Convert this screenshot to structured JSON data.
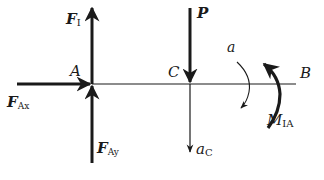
{
  "diagram": {
    "type": "free-body-diagram",
    "beam": {
      "label_left": "A",
      "label_mid": "C",
      "label_right": "B"
    },
    "forces": [
      {
        "id": "FI",
        "symbol": "F",
        "subscript": "I",
        "direction": "up",
        "at": "A"
      },
      {
        "id": "FAx",
        "symbol": "F",
        "subscript": "Ax",
        "direction": "right",
        "at": "A"
      },
      {
        "id": "FAy",
        "symbol": "F",
        "subscript": "Ay",
        "direction": "up",
        "at": "A"
      },
      {
        "id": "P",
        "symbol": "P",
        "subscript": "",
        "direction": "down",
        "at": "C"
      }
    ],
    "accelerations": [
      {
        "id": "aC",
        "symbol": "a",
        "subscript": "C",
        "direction": "down",
        "at": "C"
      },
      {
        "id": "alpha",
        "symbol": "a",
        "subscript": "",
        "direction": "clockwise"
      }
    ],
    "moments": [
      {
        "id": "MIA",
        "symbol": "M",
        "subscript": "IA",
        "direction": "counterclockwise"
      }
    ],
    "colors": {
      "ink": "#1a1a1a",
      "background": "#ffffff"
    }
  }
}
